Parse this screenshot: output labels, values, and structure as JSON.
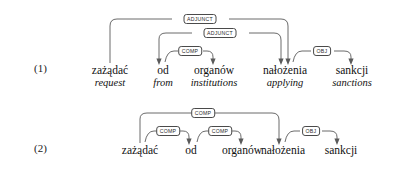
{
  "figure": {
    "type": "dependency-tree-diagram",
    "stroke_color": "#5a5a5a",
    "text_color": "#111111",
    "examples": [
      {
        "number": "(1)",
        "has_glosses": true,
        "words": [
          {
            "form": "zażądać",
            "gloss": "request"
          },
          {
            "form": "od",
            "gloss": "from"
          },
          {
            "form": "organów",
            "gloss": "institutions"
          },
          {
            "form": "nałożenia",
            "gloss": "applying"
          },
          {
            "form": "sankcji",
            "gloss": "sanctions"
          }
        ],
        "arcs": [
          {
            "label": "ADJUNCT",
            "from": "zażądać",
            "to": "nałożenia",
            "level": 3
          },
          {
            "label": "ADJUNCT",
            "from": "od",
            "to": "nałożenia",
            "level": 2,
            "direction": "reverse"
          },
          {
            "label": "COMP",
            "from": "od",
            "to": "organów",
            "level": 1
          },
          {
            "label": "OBJ",
            "from": "nałożenia",
            "to": "sankcji",
            "level": 1
          }
        ]
      },
      {
        "number": "(2)",
        "has_glosses": false,
        "words": [
          {
            "form": "zażądać",
            "gloss": ""
          },
          {
            "form": "od",
            "gloss": ""
          },
          {
            "form": "organów",
            "gloss": ""
          },
          {
            "form": "nałożenia",
            "gloss": ""
          },
          {
            "form": "sankcji",
            "gloss": ""
          }
        ],
        "arcs": [
          {
            "label": "COMP",
            "from": "zażądać",
            "to": "nałożenia",
            "level": 2
          },
          {
            "label": "COMP",
            "from": "zażądać",
            "to": "od",
            "level": 1
          },
          {
            "label": "COMP",
            "from": "od",
            "to": "organów",
            "level": 1
          },
          {
            "label": "OBJ",
            "from": "nałożenia",
            "to": "sankcji",
            "level": 1
          }
        ]
      }
    ]
  }
}
